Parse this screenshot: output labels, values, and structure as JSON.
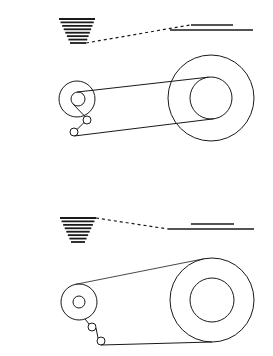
{
  "diagram": {
    "stroke_color": "#1a1a1a",
    "background": "#ffffff",
    "panels": [
      {
        "id": "top",
        "stack": {
          "top_y": 19,
          "bottom_y": 43,
          "lines": 8,
          "top_x": [
            59,
            95
          ],
          "bottom_x": [
            70,
            86
          ]
        },
        "dashed": {
          "from": [
            86,
            43
          ],
          "to": [
            190,
            25
          ]
        },
        "bars": [
          {
            "y": 25,
            "x": [
              191,
              233
            ]
          },
          {
            "y": 30,
            "x": [
              170,
              253
            ]
          }
        ],
        "small_spool": {
          "cx": 77,
          "cy": 99,
          "r_outer": 18,
          "r_inner": 7,
          "inner_cx": 78
        },
        "rollers": [
          {
            "cx": 87,
            "cy": 120,
            "r": 4
          },
          {
            "cx": 74,
            "cy": 132,
            "r": 4
          }
        ],
        "large_reel": {
          "cx": 211,
          "cy": 98,
          "r_outer": 43,
          "r_inner": 21
        }
      },
      {
        "id": "bottom",
        "stack": {
          "top_y": 218,
          "bottom_y": 242,
          "lines": 8,
          "top_x": [
            60,
            96
          ],
          "bottom_x": [
            71,
            85
          ]
        },
        "dashed": {
          "from": [
            96,
            218
          ],
          "to": [
            168,
            229
          ]
        },
        "bars": [
          {
            "y": 224,
            "x": [
              191,
              234
            ]
          },
          {
            "y": 229,
            "x": [
              168,
              254
            ]
          }
        ],
        "small_spool": {
          "cx": 79,
          "cy": 302,
          "r_outer": 18,
          "r_inner": 6
        },
        "rollers": [
          {
            "cx": 92,
            "cy": 327,
            "r": 4
          },
          {
            "cx": 101,
            "cy": 341,
            "r": 4
          }
        ],
        "large_reel": {
          "cx": 212,
          "cy": 300,
          "r_outer": 42,
          "r_inner": 22
        }
      }
    ]
  }
}
